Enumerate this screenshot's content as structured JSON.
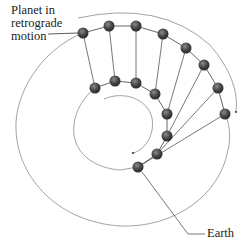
{
  "labels": {
    "planet": [
      "Planet in",
      "retrograde",
      "motion"
    ],
    "earth": "Earth"
  },
  "colors": {
    "orbit": "#8a8a8a",
    "sightline": "#555555",
    "ball": "#3a3a3a",
    "text": "#222222"
  },
  "planet_positions": [
    [
      83,
      33
    ],
    [
      109,
      26
    ],
    [
      136,
      26
    ],
    [
      163,
      34
    ],
    [
      186,
      48
    ],
    [
      204,
      65
    ],
    [
      218,
      88
    ],
    [
      225,
      114
    ]
  ],
  "earth_positions": [
    [
      95,
      88
    ],
    [
      115,
      81
    ],
    [
      136,
      83
    ],
    [
      155,
      94
    ],
    [
      167,
      114
    ],
    [
      167,
      136
    ],
    [
      157,
      154
    ],
    [
      138,
      167
    ]
  ]
}
